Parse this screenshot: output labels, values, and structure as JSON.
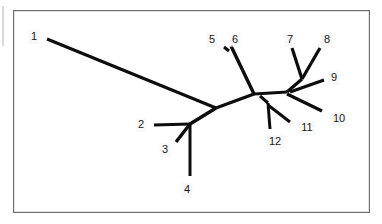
{
  "figure": {
    "kind": "unrooted-phylogenetic-tree",
    "caption": "",
    "background_color": "#ffffff",
    "line_color": "#0d0d0d",
    "frame_color": "#6f6f6f",
    "label_color": "#1a1a1a",
    "frame": {
      "x": 13,
      "y": 10,
      "width": 357,
      "height": 203
    },
    "margin_rule": {
      "x": 3,
      "y1": 6,
      "y2": 46
    }
  },
  "leaves": [
    {
      "id": "1",
      "label": "1",
      "label_x": 34,
      "label_y": 37,
      "tip_x": 47,
      "tip_y": 39
    },
    {
      "id": "2",
      "label": "2",
      "label_x": 141,
      "label_y": 125,
      "tip_x": 154,
      "tip_y": 125
    },
    {
      "id": "3",
      "label": "3",
      "label_x": 165,
      "label_y": 150,
      "tip_x": 176,
      "tip_y": 142
    },
    {
      "id": "4",
      "label": "4",
      "label_x": 187,
      "label_y": 190,
      "tip_x": 190,
      "tip_y": 176
    },
    {
      "id": "5",
      "label": "5",
      "label_x": 212,
      "label_y": 40,
      "tip_x": 224,
      "tip_y": 47
    },
    {
      "id": "6",
      "label": "6",
      "label_x": 235,
      "label_y": 40,
      "tip_x": 231,
      "tip_y": 46
    },
    {
      "id": "7",
      "label": "7",
      "label_x": 290,
      "label_y": 40,
      "tip_x": 292,
      "tip_y": 48
    },
    {
      "id": "8",
      "label": "8",
      "label_x": 327,
      "label_y": 40,
      "tip_x": 320,
      "tip_y": 48
    },
    {
      "id": "9",
      "label": "9",
      "label_x": 334,
      "label_y": 78,
      "tip_x": 324,
      "tip_y": 80
    },
    {
      "id": "10",
      "label": "10",
      "label_x": 339,
      "label_y": 119,
      "tip_x": 322,
      "tip_y": 111
    },
    {
      "id": "11",
      "label": "11",
      "label_x": 307,
      "label_y": 128,
      "tip_x": 290,
      "tip_y": 122
    },
    {
      "id": "12",
      "label": "12",
      "label_x": 275,
      "label_y": 142,
      "tip_x": 270,
      "tip_y": 129
    }
  ],
  "nodes": [
    {
      "id": "n-left-junction",
      "x": 216,
      "y": 108
    },
    {
      "id": "n-234",
      "x": 190,
      "y": 124
    },
    {
      "id": "n-hub-left",
      "x": 254,
      "y": 94
    },
    {
      "id": "n-1112",
      "x": 268,
      "y": 103
    },
    {
      "id": "n-hub-right",
      "x": 287,
      "y": 92
    },
    {
      "id": "n-78",
      "x": 302,
      "y": 79
    },
    {
      "id": "n-56",
      "x": 229,
      "y": 48
    }
  ],
  "edges": [
    {
      "name": "edge-leaf-1",
      "x1": 47,
      "y1": 39,
      "x2": 216,
      "y2": 108,
      "width": 3.0
    },
    {
      "name": "edge-leaf-2",
      "x1": 154,
      "y1": 125,
      "x2": 190,
      "y2": 124,
      "width": 3.0
    },
    {
      "name": "edge-leaf-3",
      "x1": 176,
      "y1": 142,
      "x2": 190,
      "y2": 124,
      "width": 3.4
    },
    {
      "name": "edge-leaf-4",
      "x1": 190,
      "y1": 124,
      "x2": 190,
      "y2": 176,
      "width": 3.0
    },
    {
      "name": "edge-n234-junction",
      "x1": 190,
      "y1": 124,
      "x2": 216,
      "y2": 108,
      "width": 3.6
    },
    {
      "name": "edge-junction-hub",
      "x1": 216,
      "y1": 108,
      "x2": 254,
      "y2": 94,
      "width": 3.2
    },
    {
      "name": "edge-leaf-5",
      "x1": 224,
      "y1": 47,
      "x2": 229,
      "y2": 51,
      "width": 3.0
    },
    {
      "name": "edge-6-to-hub",
      "x1": 231,
      "y1": 46,
      "x2": 254,
      "y2": 94,
      "width": 3.4
    },
    {
      "name": "edge-hub-crossbar",
      "x1": 254,
      "y1": 94,
      "x2": 287,
      "y2": 92,
      "width": 3.0
    },
    {
      "name": "edge-hub-n1112",
      "x1": 260,
      "y1": 96,
      "x2": 268,
      "y2": 103,
      "width": 3.0
    },
    {
      "name": "edge-leaf-12",
      "x1": 268,
      "y1": 103,
      "x2": 270,
      "y2": 129,
      "width": 3.0
    },
    {
      "name": "edge-leaf-11",
      "x1": 268,
      "y1": 105,
      "x2": 290,
      "y2": 122,
      "width": 3.0
    },
    {
      "name": "edge-hubright-n78",
      "x1": 287,
      "y1": 92,
      "x2": 302,
      "y2": 79,
      "width": 3.2
    },
    {
      "name": "edge-leaf-7",
      "x1": 302,
      "y1": 79,
      "x2": 292,
      "y2": 48,
      "width": 3.2
    },
    {
      "name": "edge-leaf-8",
      "x1": 302,
      "y1": 79,
      "x2": 320,
      "y2": 48,
      "width": 3.2
    },
    {
      "name": "edge-leaf-9",
      "x1": 290,
      "y1": 92,
      "x2": 324,
      "y2": 80,
      "width": 3.0
    },
    {
      "name": "edge-leaf-10",
      "x1": 287,
      "y1": 94,
      "x2": 322,
      "y2": 111,
      "width": 3.2
    }
  ]
}
